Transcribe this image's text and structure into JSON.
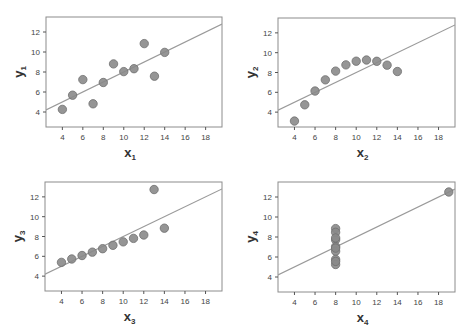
{
  "style": {
    "point_fill": "#8a8a8a",
    "point_stroke": "#6e6e6e",
    "line_color": "#9a9a9a",
    "frame_color": "#8c8c8c",
    "background": "#ffffff"
  },
  "chart_data": [
    {
      "type": "scatter",
      "xlabel": "x",
      "xlabel_sub": "1",
      "ylabel": "y",
      "ylabel_sub": "1",
      "xlim": [
        2.4,
        19.6
      ],
      "ylim": [
        2.5,
        13.5
      ],
      "xticks": [
        4,
        6,
        8,
        10,
        12,
        14,
        16,
        18
      ],
      "yticks": [
        4,
        6,
        8,
        10,
        12
      ],
      "grid": false,
      "x": [
        10,
        8,
        13,
        9,
        11,
        14,
        6,
        4,
        12,
        7,
        5
      ],
      "y": [
        8.04,
        6.95,
        7.58,
        8.81,
        8.33,
        9.96,
        7.24,
        4.26,
        10.84,
        4.82,
        5.68
      ],
      "fit_line": {
        "intercept": 3.0,
        "slope": 0.5
      }
    },
    {
      "type": "scatter",
      "xlabel": "x",
      "xlabel_sub": "2",
      "ylabel": "y",
      "ylabel_sub": "2",
      "xlim": [
        2.4,
        19.6
      ],
      "ylim": [
        2.5,
        13.5
      ],
      "xticks": [
        4,
        6,
        8,
        10,
        12,
        14,
        16,
        18
      ],
      "yticks": [
        4,
        6,
        8,
        10,
        12
      ],
      "grid": false,
      "x": [
        10,
        8,
        13,
        9,
        11,
        14,
        6,
        4,
        12,
        7,
        5
      ],
      "y": [
        9.14,
        8.14,
        8.74,
        8.77,
        9.26,
        8.1,
        6.13,
        3.1,
        9.13,
        7.26,
        4.74
      ],
      "fit_line": {
        "intercept": 3.0,
        "slope": 0.5
      }
    },
    {
      "type": "scatter",
      "xlabel": "x",
      "xlabel_sub": "3",
      "ylabel": "y",
      "ylabel_sub": "3",
      "xlim": [
        2.4,
        19.6
      ],
      "ylim": [
        2.5,
        13.5
      ],
      "xticks": [
        4,
        6,
        8,
        10,
        12,
        14,
        16,
        18
      ],
      "yticks": [
        4,
        6,
        8,
        10,
        12
      ],
      "grid": false,
      "x": [
        10,
        8,
        13,
        9,
        11,
        14,
        6,
        4,
        12,
        7,
        5
      ],
      "y": [
        7.46,
        6.77,
        12.74,
        7.11,
        7.81,
        8.84,
        6.08,
        5.39,
        8.15,
        6.42,
        5.73
      ],
      "fit_line": {
        "intercept": 3.0,
        "slope": 0.5
      }
    },
    {
      "type": "scatter",
      "xlabel": "x",
      "xlabel_sub": "4",
      "ylabel": "y",
      "ylabel_sub": "4",
      "xlim": [
        2.4,
        19.6
      ],
      "ylim": [
        2.5,
        13.5
      ],
      "xticks": [
        4,
        6,
        8,
        10,
        12,
        14,
        16,
        18
      ],
      "yticks": [
        4,
        6,
        8,
        10,
        12
      ],
      "grid": false,
      "x": [
        8,
        8,
        8,
        8,
        8,
        8,
        8,
        19,
        8,
        8,
        8
      ],
      "y": [
        6.58,
        5.76,
        7.71,
        8.84,
        8.47,
        7.04,
        5.25,
        12.5,
        5.56,
        7.91,
        6.89
      ],
      "fit_line": {
        "intercept": 3.0,
        "slope": 0.5
      }
    }
  ],
  "panels": [
    {
      "frame": {
        "left": 46,
        "top": 17,
        "right": 222,
        "bottom": 127
      }
    },
    {
      "frame": {
        "left": 278,
        "top": 18,
        "right": 455,
        "bottom": 127
      }
    },
    {
      "frame": {
        "left": 45,
        "top": 182,
        "right": 222,
        "bottom": 291
      }
    },
    {
      "frame": {
        "left": 278,
        "top": 182,
        "right": 455,
        "bottom": 292
      }
    }
  ]
}
